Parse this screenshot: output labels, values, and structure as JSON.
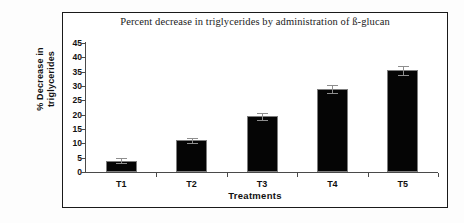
{
  "chart_data": {
    "type": "bar",
    "title": "Percent decrease in triglycerides by administration of ß-glucan",
    "categories": [
      "T1",
      "T2",
      "T3",
      "T4",
      "T5"
    ],
    "values": [
      4,
      11,
      19.5,
      29,
      35.5
    ],
    "errors": [
      1,
      1,
      1.2,
      1.5,
      1.5
    ],
    "xlabel": "Treatments",
    "ylabel_line1": "% Decrease in",
    "ylabel_line2": "triglycerides",
    "ylabel": "% Decrease in triglycerides",
    "ylim": [
      0,
      45
    ],
    "ytick_labels": [
      "45",
      "40",
      "35",
      "30",
      "25",
      "20",
      "15",
      "10",
      "5",
      "0"
    ],
    "ytick_values": [
      45,
      40,
      35,
      30,
      25,
      20,
      15,
      10,
      5,
      0
    ],
    "grid": false,
    "legend": "none",
    "bar_color": "#050505",
    "bar_edge_color": "#7d7d7d",
    "axis_color": "#4a4a4a",
    "error_bar_color": "#8e8e8e",
    "background_color": "#ffffff",
    "frame_color": "#1a1a1a"
  }
}
